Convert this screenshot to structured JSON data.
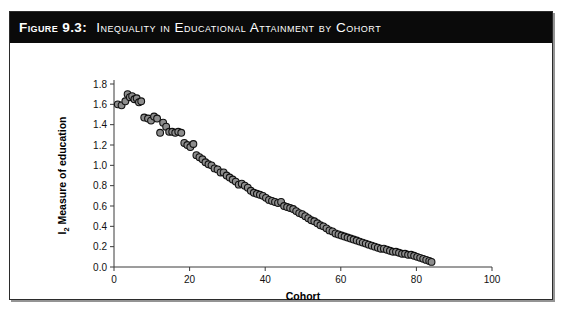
{
  "figure": {
    "number_label": "Figure 9.3:",
    "title": "Inequality in Educational Attainment by Cohort",
    "caption_background": "#0a0a0a",
    "caption_text_color": "#ffffff",
    "border_color": "#2b2b2b"
  },
  "chart_data": {
    "type": "scatter",
    "title": "Inequality in Educational Attainment by Cohort",
    "xlabel": "Cohort",
    "ylabel": "I2 Measure of education",
    "ylabel_main": "Measure of education",
    "ylabel_prefix": "I",
    "ylabel_subscript": "2",
    "xlim": [
      0,
      100
    ],
    "ylim": [
      0.0,
      1.8
    ],
    "xticks": [
      0,
      20,
      40,
      60,
      80,
      100
    ],
    "xtick_labels": [
      "0",
      "20",
      "40",
      "60",
      "80",
      "100"
    ],
    "yticks": [
      0.0,
      0.2,
      0.4,
      0.6,
      0.8,
      1.0,
      1.2,
      1.4,
      1.6,
      1.8
    ],
    "ytick_labels": [
      "0.0",
      "0.2",
      "0.4",
      "0.6",
      "0.8",
      "1.0",
      "1.2",
      "1.4",
      "1.6",
      "1.8"
    ],
    "grid": false,
    "legend": null,
    "marker_fill": "#8d8d8d",
    "marker_edge": "#111111",
    "marker_radius": 3.4,
    "x": [
      1.0,
      2.0,
      3.0,
      3.6,
      4.2,
      4.8,
      5.4,
      6.0,
      6.6,
      7.2,
      8.0,
      9.0,
      9.8,
      10.6,
      11.4,
      12.2,
      13.0,
      13.8,
      14.6,
      15.4,
      16.2,
      17.0,
      17.8,
      18.6,
      19.4,
      20.2,
      21.0,
      21.8,
      22.6,
      23.4,
      24.2,
      25.0,
      25.8,
      26.6,
      27.4,
      28.2,
      29.0,
      29.8,
      30.6,
      31.4,
      32.2,
      33.0,
      33.8,
      34.6,
      35.4,
      36.2,
      37.0,
      37.8,
      38.6,
      39.4,
      40.2,
      41.0,
      41.8,
      42.6,
      43.4,
      44.2,
      45.0,
      45.8,
      46.6,
      47.4,
      48.2,
      49.0,
      49.8,
      50.6,
      51.4,
      52.2,
      53.0,
      53.8,
      54.6,
      55.4,
      56.2,
      57.0,
      57.8,
      58.6,
      59.4,
      60.2,
      61.0,
      61.8,
      62.6,
      63.4,
      64.2,
      65.0,
      65.8,
      66.6,
      67.4,
      68.2,
      69.0,
      69.8,
      70.6,
      71.4,
      72.2,
      73.0,
      73.8,
      74.6,
      75.4,
      76.2,
      77.0,
      77.8,
      78.6,
      79.4,
      80.2,
      81.0,
      81.8,
      82.6,
      83.4,
      84.0
    ],
    "y": [
      1.6,
      1.59,
      1.63,
      1.7,
      1.67,
      1.68,
      1.65,
      1.66,
      1.62,
      1.63,
      1.47,
      1.46,
      1.44,
      1.48,
      1.46,
      1.32,
      1.42,
      1.38,
      1.33,
      1.33,
      1.32,
      1.33,
      1.32,
      1.22,
      1.2,
      1.18,
      1.21,
      1.1,
      1.08,
      1.06,
      1.03,
      1.01,
      1.0,
      0.97,
      0.96,
      0.93,
      0.93,
      0.9,
      0.88,
      0.86,
      0.84,
      0.81,
      0.82,
      0.8,
      0.78,
      0.75,
      0.73,
      0.72,
      0.71,
      0.7,
      0.68,
      0.66,
      0.65,
      0.64,
      0.63,
      0.64,
      0.6,
      0.59,
      0.58,
      0.57,
      0.55,
      0.53,
      0.52,
      0.5,
      0.48,
      0.46,
      0.45,
      0.43,
      0.41,
      0.4,
      0.38,
      0.36,
      0.35,
      0.33,
      0.32,
      0.31,
      0.3,
      0.29,
      0.28,
      0.27,
      0.26,
      0.25,
      0.24,
      0.23,
      0.22,
      0.21,
      0.2,
      0.19,
      0.18,
      0.18,
      0.17,
      0.16,
      0.15,
      0.15,
      0.14,
      0.13,
      0.13,
      0.12,
      0.12,
      0.11,
      0.1,
      0.09,
      0.08,
      0.07,
      0.06,
      0.05
    ]
  }
}
